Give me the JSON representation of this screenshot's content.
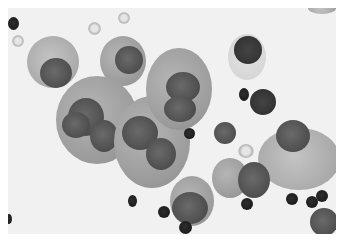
{
  "image": {
    "description": "Grayscale cytology micrograph showing large atypical cells with prominent nuclei, multinucleated cells, and scattered small dark lymphocytes and red blood cells on a pale background",
    "background_color": "#f1f1f1",
    "cytoplasm_color": "#a5a5a5",
    "nucleus_color": "#4e4e4e",
    "lymphocyte_color": "#1e1e1e"
  }
}
